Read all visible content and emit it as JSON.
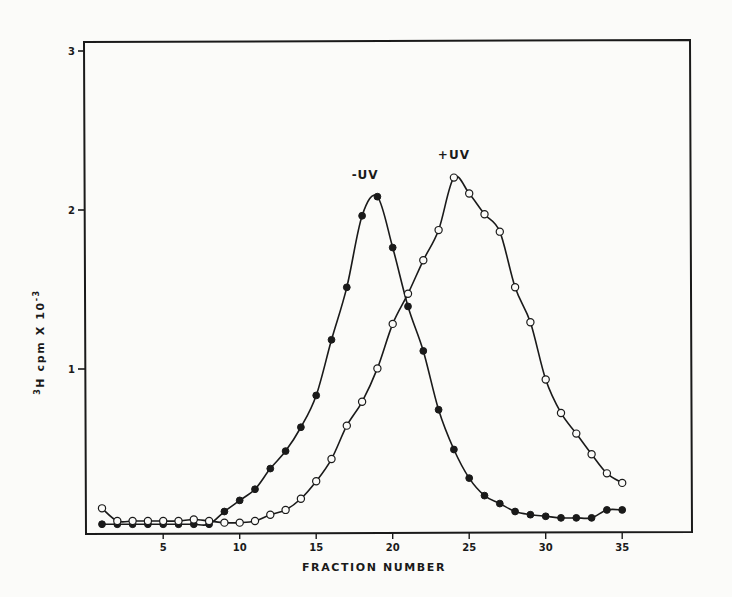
{
  "chart_data": {
    "type": "line",
    "title": "",
    "xlabel": "FRACTION NUMBER",
    "ylabel": "3H cpm X 10-3",
    "ylabel_parts": {
      "pre_sup": "3",
      "main": "H  cpm  X 10",
      "post_sup": "-3"
    },
    "xlim": [
      0,
      36
    ],
    "ylim": [
      0,
      3
    ],
    "x_ticks": [
      5,
      10,
      15,
      20,
      25,
      30,
      35
    ],
    "y_ticks": [
      1,
      2,
      3
    ],
    "grid": false,
    "legend": "inline labels",
    "x": [
      1,
      2,
      3,
      4,
      5,
      6,
      7,
      8,
      9,
      10,
      11,
      12,
      13,
      14,
      15,
      16,
      17,
      18,
      19,
      20,
      21,
      22,
      23,
      24,
      25,
      26,
      27,
      28,
      29,
      30,
      31,
      32,
      33,
      34,
      35
    ],
    "series": [
      {
        "name": "-UV",
        "marker": "filled-circle",
        "values": [
          0.03,
          0.03,
          0.03,
          0.03,
          0.03,
          0.03,
          0.03,
          0.03,
          0.11,
          0.18,
          0.25,
          0.38,
          0.49,
          0.64,
          0.84,
          1.19,
          1.52,
          1.97,
          2.09,
          1.77,
          1.4,
          1.12,
          0.75,
          0.5,
          0.32,
          0.21,
          0.16,
          0.11,
          0.09,
          0.08,
          0.07,
          0.07,
          0.07,
          0.12,
          0.12
        ],
        "label_pos": {
          "x": 18.2,
          "y": 2.2
        }
      },
      {
        "name": "+UV",
        "marker": "open-circle",
        "values": [
          0.13,
          0.05,
          0.05,
          0.05,
          0.05,
          0.05,
          0.06,
          0.05,
          0.04,
          0.04,
          0.05,
          0.09,
          0.12,
          0.19,
          0.3,
          0.44,
          0.65,
          0.8,
          1.01,
          1.29,
          1.48,
          1.69,
          1.88,
          2.21,
          2.11,
          1.98,
          1.87,
          1.52,
          1.3,
          0.94,
          0.73,
          0.6,
          0.47,
          0.35,
          0.29
        ],
        "label_pos": {
          "x": 24.0,
          "y": 2.33
        }
      }
    ]
  },
  "labels": {
    "x_axis": "FRACTION NUMBER",
    "series_minus": "-UV",
    "series_plus": "+UV"
  }
}
